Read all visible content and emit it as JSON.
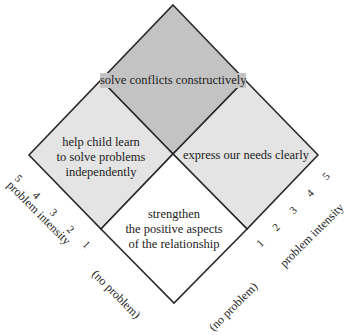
{
  "diagram": {
    "colors": {
      "top": "#c3c3c3",
      "left": "#e4e4e4",
      "right": "#e4e4e4",
      "bottom": "#ffffff",
      "stroke": "#2a2a2a"
    },
    "regions": {
      "top": {
        "label": "solve conflicts constructively"
      },
      "left": {
        "lines": [
          "help child learn",
          "to solve problems",
          "independently"
        ]
      },
      "right": {
        "label": "express our needs clearly"
      },
      "bottom": {
        "lines": [
          "strengthen",
          "the positive aspects",
          "of the relationship"
        ]
      }
    },
    "left_axis": {
      "title": "problem intensity",
      "ticks": [
        "1",
        "2",
        "3",
        "4",
        "5"
      ],
      "zero_label": "(no problem)"
    },
    "right_axis": {
      "title": "problem intensity",
      "ticks": [
        "1",
        "2",
        "3",
        "4",
        "5"
      ],
      "zero_label": "(no problem)"
    }
  }
}
